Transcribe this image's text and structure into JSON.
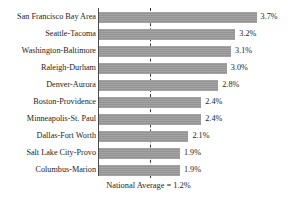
{
  "chart_data": {
    "type": "bar",
    "orientation": "horizontal",
    "title": "",
    "subtitle": "",
    "xlabel": "",
    "ylabel": "",
    "categories": [
      "San Francisco Bay Area",
      "Seattle-Tacoma",
      "Washington-Baltimore",
      "Raleigh-Durham",
      "Denver-Aurora",
      "Boston-Providence",
      "Minneapolis-St. Paul",
      "Dallas-Fort Worth",
      "Salt Lake City-Provo",
      "Columbus-Marion"
    ],
    "values": [
      3.7,
      3.2,
      3.1,
      3.0,
      2.8,
      2.4,
      2.4,
      2.1,
      1.9,
      1.9
    ],
    "value_labels": [
      "3.7%",
      "3.2%",
      "3.1%",
      "3.0%",
      "2.8%",
      "2.4%",
      "2.4%",
      "2.1%",
      "1.9%",
      "1.9%"
    ],
    "xlim": [
      0,
      4.0
    ],
    "grid": false,
    "legend": "none",
    "bar_color": "#9a9a9a",
    "reference_line": {
      "value": 1.2,
      "style": "dashed",
      "color": "#3a3a3a",
      "label": "National Average = 1.2%"
    }
  },
  "caption": {
    "text": "National Average = 1.2%"
  }
}
